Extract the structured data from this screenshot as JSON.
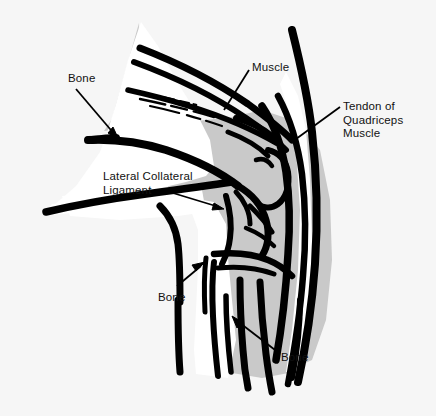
{
  "figure": {
    "view": "lateral (side) view of a flexed knee",
    "colors": {
      "page_background": "#f7f7f7",
      "outer_background": "#f2f2f2",
      "bone_fill": "#ffffff",
      "soft_tissue_shading": "#c8c8c8",
      "ink": "#000000",
      "text": "#111111"
    },
    "labels": [
      {
        "id": "bone-top",
        "text": "Bone",
        "pointer": "arrow",
        "points_to": "femur shaft upper left"
      },
      {
        "id": "muscle",
        "text": "Muscle",
        "pointer": "leader-line",
        "points_to": "quadriceps muscle belly"
      },
      {
        "id": "tendon",
        "lines": [
          "Tendon of",
          "Quadriceps",
          "Muscle"
        ],
        "text": "Tendon of Quadriceps Muscle",
        "pointer": "leader-line",
        "points_to": "quadriceps tendon anterior to knee"
      },
      {
        "id": "lateral-collateral-ligament",
        "lines": [
          "Lateral Collateral",
          "Ligament"
        ],
        "text": "Lateral Collateral Ligament",
        "pointer": "arrow",
        "points_to": "lateral collateral ligament at joint line"
      },
      {
        "id": "bone-mid",
        "text": "Bone",
        "pointer": "arrow",
        "points_to": "fibula head"
      },
      {
        "id": "bone-bottom",
        "text": "Bone",
        "pointer": "arrow",
        "points_to": "tibia shaft lower right"
      }
    ]
  }
}
